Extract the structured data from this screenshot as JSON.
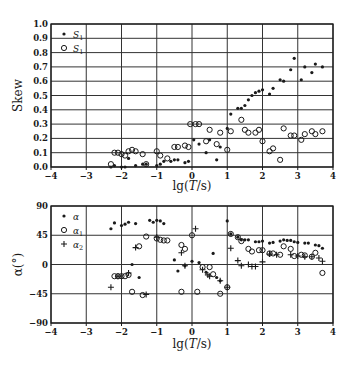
{
  "chart_data": [
    {
      "type": "scatter",
      "title": "",
      "xlabel": "lg(T/s)",
      "ylabel": "Skew",
      "xlim": [
        -4,
        4
      ],
      "ylim": [
        0.0,
        1.0
      ],
      "grid": true,
      "legend_position": "upper left",
      "xticks": [
        "−4",
        "−3",
        "−2",
        "−1",
        "0",
        "1",
        "2",
        "3",
        "4"
      ],
      "yticks": [
        "0.0",
        "0.1",
        "0.2",
        "0.3",
        "0.4",
        "0.5",
        "0.6",
        "0.7",
        "0.8",
        "0.9",
        "1.0"
      ],
      "series": [
        {
          "name": "S",
          "legend_label": "S",
          "legend_sub": "1",
          "marker": "filled-dot",
          "points": [
            [
              -2.3,
              0.0
            ],
            [
              -2.2,
              0.01
            ],
            [
              -2.0,
              0.0
            ],
            [
              -1.9,
              0.0
            ],
            [
              -1.8,
              0.06
            ],
            [
              -1.6,
              0.01
            ],
            [
              -1.4,
              0.02
            ],
            [
              -1.3,
              0.02
            ],
            [
              -1.0,
              0.01
            ],
            [
              -0.9,
              0.02
            ],
            [
              -0.8,
              0.04
            ],
            [
              -0.6,
              0.04
            ],
            [
              -0.5,
              0.05
            ],
            [
              -0.4,
              0.05
            ],
            [
              -0.2,
              0.03
            ],
            [
              -0.1,
              0.04
            ],
            [
              0.05,
              0.19
            ],
            [
              0.2,
              0.16
            ],
            [
              0.4,
              0.1
            ],
            [
              0.5,
              0.19
            ],
            [
              0.7,
              0.05
            ],
            [
              0.8,
              0.14
            ],
            [
              1.0,
              0.27
            ],
            [
              1.1,
              0.37
            ],
            [
              1.3,
              0.41
            ],
            [
              1.4,
              0.41
            ],
            [
              1.5,
              0.43
            ],
            [
              1.6,
              0.47
            ],
            [
              1.7,
              0.5
            ],
            [
              1.8,
              0.52
            ],
            [
              1.9,
              0.53
            ],
            [
              2.0,
              0.54
            ],
            [
              2.2,
              0.51
            ],
            [
              2.3,
              0.55
            ],
            [
              2.5,
              0.61
            ],
            [
              2.6,
              0.6
            ],
            [
              2.8,
              0.68
            ],
            [
              2.9,
              0.76
            ],
            [
              3.1,
              0.61
            ],
            [
              3.2,
              0.7
            ],
            [
              3.4,
              0.66
            ],
            [
              3.5,
              0.72
            ],
            [
              3.7,
              0.7
            ]
          ]
        },
        {
          "name": "S1",
          "legend_label": "S",
          "legend_sub": "1",
          "marker": "open-circle",
          "points": [
            [
              -2.3,
              0.02
            ],
            [
              -2.2,
              0.1
            ],
            [
              -2.1,
              0.1
            ],
            [
              -2.0,
              0.09
            ],
            [
              -1.9,
              0.08
            ],
            [
              -1.8,
              0.11
            ],
            [
              -1.7,
              0.12
            ],
            [
              -1.6,
              0.11
            ],
            [
              -1.4,
              0.09
            ],
            [
              -1.3,
              0.02
            ],
            [
              -1.0,
              0.11
            ],
            [
              -0.9,
              0.08
            ],
            [
              -0.7,
              0.06
            ],
            [
              -0.5,
              0.14
            ],
            [
              -0.4,
              0.14
            ],
            [
              -0.2,
              0.15
            ],
            [
              -0.1,
              0.14
            ],
            [
              -0.05,
              0.3
            ],
            [
              0.1,
              0.3
            ],
            [
              0.2,
              0.3
            ],
            [
              0.4,
              0.18
            ],
            [
              0.5,
              0.26
            ],
            [
              0.7,
              0.16
            ],
            [
              0.8,
              0.24
            ],
            [
              1.0,
              0.12
            ],
            [
              1.1,
              0.25
            ],
            [
              1.4,
              0.33
            ],
            [
              1.5,
              0.26
            ],
            [
              1.6,
              0.24
            ],
            [
              1.8,
              0.24
            ],
            [
              1.9,
              0.26
            ],
            [
              2.0,
              0.18
            ],
            [
              2.2,
              0.11
            ],
            [
              2.3,
              0.13
            ],
            [
              2.5,
              0.05
            ],
            [
              2.6,
              0.27
            ],
            [
              2.8,
              0.22
            ],
            [
              2.9,
              0.22
            ],
            [
              3.1,
              0.19
            ],
            [
              3.2,
              0.23
            ],
            [
              3.4,
              0.25
            ],
            [
              3.5,
              0.23
            ],
            [
              3.7,
              0.25
            ]
          ]
        }
      ]
    },
    {
      "type": "scatter",
      "title": "",
      "xlabel": "lg(T/s)",
      "ylabel": "α(°)",
      "xlim": [
        -4,
        4
      ],
      "ylim": [
        -90,
        90
      ],
      "grid": true,
      "legend_position": "upper left",
      "xticks": [
        "−4",
        "−3",
        "−2",
        "−1",
        "0",
        "1",
        "2",
        "3",
        "4"
      ],
      "yticks": [
        "−90",
        "−45",
        "0",
        "45",
        "90"
      ],
      "series": [
        {
          "name": "α",
          "legend_label": "α",
          "legend_sub": "",
          "marker": "filled-dot",
          "points": [
            [
              -2.3,
              55
            ],
            [
              -2.2,
              64
            ],
            [
              -2.0,
              60
            ],
            [
              -1.9,
              62
            ],
            [
              -1.8,
              65
            ],
            [
              -1.6,
              63
            ],
            [
              -1.2,
              68
            ],
            [
              -1.1,
              65
            ],
            [
              -1.0,
              68
            ],
            [
              -0.9,
              67
            ],
            [
              -0.8,
              63
            ],
            [
              -1.7,
              0
            ],
            [
              -1.5,
              -20
            ],
            [
              -0.5,
              7
            ],
            [
              -0.4,
              -10
            ],
            [
              -0.2,
              -2
            ],
            [
              0.0,
              5
            ],
            [
              0.2,
              3
            ],
            [
              0.4,
              -12
            ],
            [
              0.6,
              17
            ],
            [
              0.7,
              -20
            ],
            [
              0.8,
              -25
            ],
            [
              1.0,
              67
            ],
            [
              1.1,
              47
            ],
            [
              1.3,
              42
            ],
            [
              1.4,
              38
            ],
            [
              1.5,
              38
            ],
            [
              1.6,
              38
            ],
            [
              1.8,
              35
            ],
            [
              1.9,
              35
            ],
            [
              2.0,
              36
            ],
            [
              2.2,
              33
            ],
            [
              2.3,
              34
            ],
            [
              2.5,
              36
            ],
            [
              2.6,
              38
            ],
            [
              2.7,
              37
            ],
            [
              2.8,
              37
            ],
            [
              2.9,
              35
            ],
            [
              3.0,
              34
            ],
            [
              3.2,
              33
            ],
            [
              3.3,
              33
            ],
            [
              3.5,
              30
            ],
            [
              3.6,
              29
            ],
            [
              3.7,
              25
            ]
          ]
        },
        {
          "name": "α1",
          "legend_label": "α",
          "legend_sub": "1",
          "marker": "open-circle",
          "points": [
            [
              -2.2,
              -18
            ],
            [
              -2.1,
              -18
            ],
            [
              -2.0,
              -18
            ],
            [
              -1.9,
              -18
            ],
            [
              -1.8,
              -16
            ],
            [
              -1.7,
              -42
            ],
            [
              -1.4,
              -47
            ],
            [
              -1.5,
              28
            ],
            [
              -1.3,
              43
            ],
            [
              -1.0,
              40
            ],
            [
              -0.9,
              38
            ],
            [
              -0.8,
              37
            ],
            [
              -0.7,
              37
            ],
            [
              -0.3,
              30
            ],
            [
              -0.2,
              24
            ],
            [
              0.0,
              45
            ],
            [
              0.15,
              -42
            ],
            [
              -0.3,
              -42
            ],
            [
              0.3,
              -4
            ],
            [
              0.5,
              -4
            ],
            [
              0.6,
              -15
            ],
            [
              0.8,
              -45
            ],
            [
              1.0,
              -35
            ],
            [
              1.1,
              47
            ],
            [
              1.3,
              42
            ],
            [
              1.4,
              36
            ],
            [
              1.6,
              24
            ],
            [
              1.7,
              20
            ],
            [
              1.9,
              22
            ],
            [
              2.0,
              22
            ],
            [
              2.2,
              17
            ],
            [
              2.3,
              17
            ],
            [
              2.5,
              15
            ],
            [
              2.6,
              28
            ],
            [
              2.8,
              24
            ],
            [
              2.9,
              13
            ],
            [
              3.1,
              15
            ],
            [
              3.2,
              14
            ],
            [
              3.4,
              12
            ],
            [
              3.5,
              18
            ],
            [
              3.7,
              -13
            ]
          ]
        },
        {
          "name": "α2",
          "legend_label": "α",
          "legend_sub": "2",
          "marker": "plus",
          "points": [
            [
              -2.3,
              -35
            ],
            [
              -2.1,
              -18
            ],
            [
              -1.8,
              -13
            ],
            [
              -1.6,
              26
            ],
            [
              -1.3,
              -46
            ],
            [
              -1.0,
              42
            ],
            [
              -0.3,
              18
            ],
            [
              -0.2,
              -2
            ],
            [
              0.1,
              55
            ],
            [
              0.3,
              -8
            ],
            [
              0.45,
              -16
            ],
            [
              0.5,
              -18
            ],
            [
              0.8,
              -25
            ],
            [
              1.0,
              -35
            ],
            [
              1.1,
              25
            ],
            [
              1.3,
              6
            ],
            [
              1.4,
              -2
            ],
            [
              1.6,
              0
            ],
            [
              1.7,
              -3
            ],
            [
              1.8,
              -3
            ],
            [
              2.0,
              4
            ],
            [
              2.2,
              16
            ],
            [
              2.4,
              15
            ],
            [
              2.8,
              15
            ],
            [
              3.0,
              13
            ],
            [
              3.2,
              12
            ],
            [
              3.4,
              12
            ],
            [
              3.6,
              10
            ],
            [
              3.7,
              5
            ]
          ]
        }
      ]
    }
  ],
  "layout": {
    "panels": [
      {
        "left": 51,
        "right": 333,
        "top": 24,
        "bottom": 167,
        "xlabel_y": 190,
        "ylabel_x": 22
      },
      {
        "left": 51,
        "right": 333,
        "top": 206,
        "bottom": 323,
        "xlabel_y": 348,
        "ylabel_x": 22
      }
    ],
    "ink_color": "#1a1a1a",
    "grid_color": "#333333"
  }
}
